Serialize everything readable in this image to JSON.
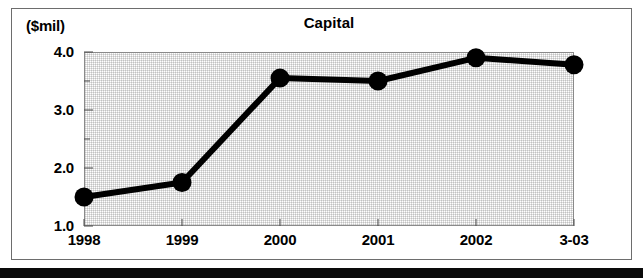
{
  "chart_data": {
    "type": "line",
    "title": "Capital",
    "subtitle": "",
    "unit_label": "($mil)",
    "xlabel": "",
    "ylabel": "",
    "categories": [
      "1998",
      "1999",
      "2000",
      "2001",
      "2002",
      "3-03"
    ],
    "values": [
      1.5,
      1.75,
      3.55,
      3.5,
      3.9,
      3.78
    ],
    "series": [
      {
        "name": "Capital",
        "values": [
          1.5,
          1.75,
          3.55,
          3.5,
          3.9,
          3.78
        ]
      }
    ],
    "ylim": [
      1.0,
      4.0
    ],
    "ytick_labels": [
      "1.0",
      "2.0",
      "3.0",
      "4.0"
    ],
    "ytick_values": [
      1.0,
      2.0,
      3.0,
      4.0
    ],
    "yminor_tick_values": [
      1.5,
      2.5,
      3.5
    ],
    "xtick_labels": [
      "1998",
      "1999",
      "2000",
      "2001",
      "2002",
      "3-03"
    ],
    "grid": false,
    "legend": "none",
    "marker": "filled-circle",
    "line_color": "#000000",
    "marker_color": "#000000",
    "plot_background": "#dcdcdc",
    "frame_color": "#6d6d6d"
  }
}
